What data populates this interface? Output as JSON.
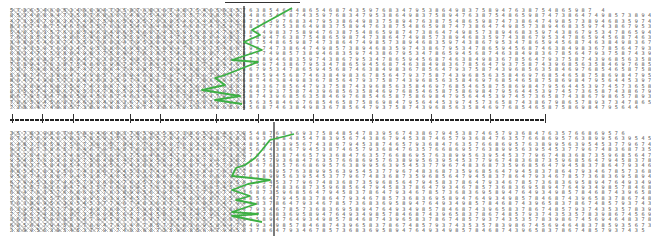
{
  "figure": {
    "colors": {
      "scanpath": "#3cb043",
      "boundary": "#222222",
      "digits": "#555555",
      "dense_region": "#777777"
    },
    "top_panel": {
      "rows_count": 19,
      "first_row": "5786546853468947358768367487546563576385463486546874359768347953864983758947638754865987 4",
      "row_2": "5397457365874386798657893734786543458768653764863695746758587654765384759876543578657 3",
      "last_row": "73864749857389468359743867953478659456874638498367856479375874396856358469768546587586984795644",
      "boundary_x": 244,
      "dense_region_right_x": 240,
      "scanpath_points": [
        [
          292,
          8
        ],
        [
          252,
          30
        ],
        [
          260,
          35
        ],
        [
          244,
          42
        ],
        [
          262,
          50
        ],
        [
          232,
          60
        ],
        [
          258,
          62
        ],
        [
          225,
          75
        ],
        [
          215,
          78
        ],
        [
          225,
          85
        ],
        [
          202,
          90
        ],
        [
          240,
          96
        ],
        [
          215,
          100
        ],
        [
          242,
          104
        ]
      ]
    },
    "bottom_panel": {
      "rows_count": 19,
      "first_row": "357839867456946483785935673865784679548768369375848547839567438679453874657936847635766869576",
      "last_row": "389956395453779674836873596856479458378647934678573683695894764934985784687439658378674857937435",
      "boundary_x": 274,
      "dense_region_right_x": 245,
      "scanpath_points": [
        [
          294,
          134
        ],
        [
          270,
          140
        ],
        [
          262,
          150
        ],
        [
          255,
          158
        ],
        [
          245,
          165
        ],
        [
          236,
          168
        ],
        [
          232,
          176
        ],
        [
          270,
          180
        ],
        [
          248,
          184
        ],
        [
          232,
          190
        ],
        [
          250,
          196
        ],
        [
          236,
          200
        ],
        [
          256,
          204
        ],
        [
          232,
          212
        ],
        [
          258,
          214
        ],
        [
          232,
          216
        ],
        [
          262,
          222
        ]
      ]
    },
    "top_rule": {
      "x1": 225,
      "x2": 300
    },
    "separator_ticks_x": [
      12,
      42,
      73,
      130,
      160,
      216,
      258,
      313,
      372,
      431,
      490,
      545
    ]
  }
}
